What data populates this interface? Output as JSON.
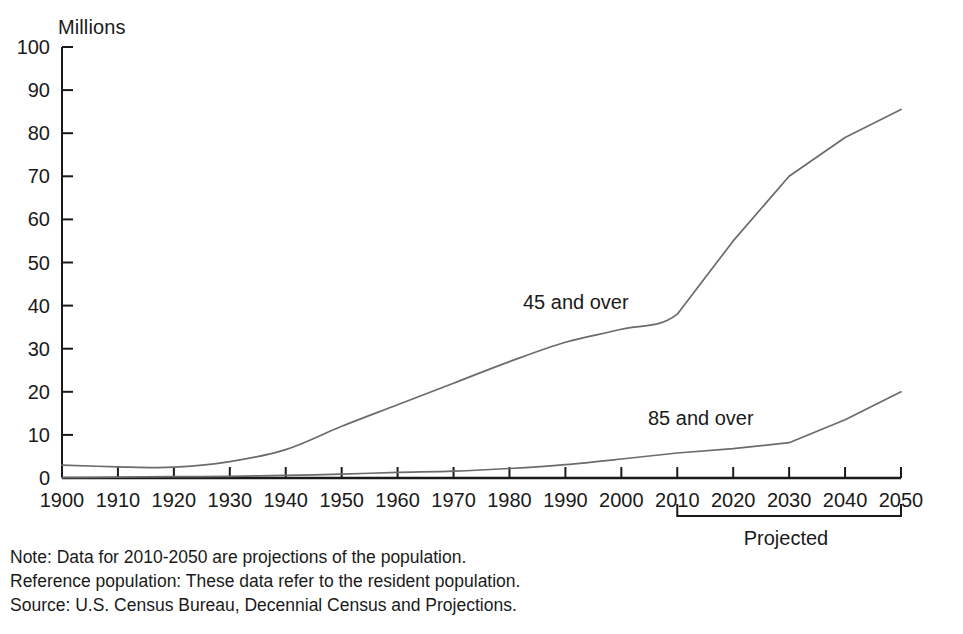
{
  "chart_data": {
    "type": "line",
    "title": "",
    "ylabel": "Millions",
    "xlabel": "",
    "ylim": [
      0,
      100
    ],
    "xlim": [
      1900,
      2050
    ],
    "grid": false,
    "legend_position": "inline-annotation",
    "y_ticks": [
      0,
      10,
      20,
      30,
      40,
      50,
      60,
      70,
      80,
      90,
      100
    ],
    "x_ticks": [
      1900,
      1910,
      1920,
      1930,
      1940,
      1950,
      1960,
      1970,
      1980,
      1990,
      2000,
      2010,
      2020,
      2030,
      2040,
      2050
    ],
    "x": [
      1900,
      1910,
      1920,
      1930,
      1940,
      1950,
      1960,
      1970,
      1980,
      1990,
      2000,
      2010,
      2020,
      2030,
      2040,
      2050
    ],
    "series": [
      {
        "name": "45 and over",
        "label": "45 and over",
        "color": "#6b6b6b",
        "values": [
          3.0,
          2.6,
          2.5,
          3.8,
          6.6,
          12.0,
          17.0,
          22.0,
          27.0,
          31.5,
          34.5,
          38.0,
          55.0,
          70.0,
          79.0,
          85.5
        ]
      },
      {
        "name": "85 and over",
        "label": "85 and over",
        "color": "#6b6b6b",
        "values": [
          0.1,
          0.2,
          0.3,
          0.4,
          0.6,
          0.9,
          1.3,
          1.6,
          2.2,
          3.1,
          4.4,
          5.8,
          6.8,
          8.2,
          13.5,
          20.0
        ]
      }
    ],
    "annotations": [
      {
        "text": "45 and over",
        "x": 1990,
        "y": 41
      },
      {
        "text": "85 and over",
        "x": 2017,
        "y": 17
      },
      {
        "text": "Projected",
        "x": 2030,
        "y": -18
      }
    ],
    "projection_bracket": {
      "label": "Projected",
      "from": 2010,
      "to": 2050
    }
  },
  "axis": {
    "unit_label": "Millions",
    "y_tick_labels": [
      "0",
      "10",
      "20",
      "30",
      "40",
      "50",
      "60",
      "70",
      "80",
      "90",
      "100"
    ],
    "x_tick_labels": [
      "1900",
      "1910",
      "1920",
      "1930",
      "1940",
      "1950",
      "1960",
      "1970",
      "1980",
      "1990",
      "2000",
      "2010",
      "2020",
      "2030",
      "2040",
      "2050"
    ]
  },
  "series_labels": {
    "upper": "45 and over",
    "lower": "85 and over"
  },
  "bracket": {
    "label": "Projected"
  },
  "footnotes": {
    "note": "Note: Data for 2010-2050 are projections of the population.",
    "reference": "Reference population: These data refer to the resident population.",
    "source": "Source: U.S. Census Bureau, Decennial Census and Projections."
  },
  "colors": {
    "line": "#6b6b6b",
    "axis": "#1a1a1a",
    "text": "#1a1a1a",
    "background": "#ffffff"
  }
}
